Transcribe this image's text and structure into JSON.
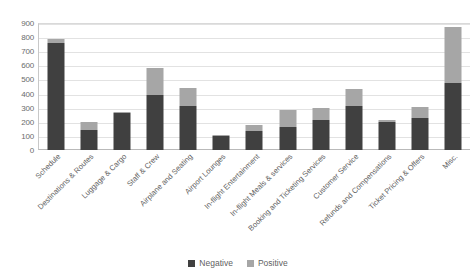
{
  "chart_data": {
    "type": "bar",
    "stacked": true,
    "title": "",
    "subtitle": "",
    "xlabel": "",
    "ylabel": "",
    "ylim": [
      0,
      900
    ],
    "ytick_step": 100,
    "yticks": [
      "900",
      "800",
      "700",
      "600",
      "500",
      "400",
      "300",
      "200",
      "100",
      "0"
    ],
    "grid": true,
    "legend_position": "bottom",
    "categories": [
      "Schedule",
      "Destinations & Routes",
      "Luggage & Cargo",
      "Staff & Crew",
      "Airplane and Seating",
      "Airport Lounges",
      "In-flight Entertainment",
      "In-flight Meals & services",
      "Booking and Ticketing Services",
      "Customer Service",
      "Refunds and Compensations",
      "Ticket Pricing & Offers",
      "Misc."
    ],
    "series": [
      {
        "name": "Negative",
        "color": "#404040",
        "values": [
          755,
          140,
          265,
          390,
          312,
          100,
          135,
          165,
          215,
          310,
          195,
          230,
          475
        ]
      },
      {
        "name": "Positive",
        "color": "#a6a6a6",
        "values": [
          35,
          60,
          5,
          190,
          131,
          5,
          40,
          120,
          85,
          120,
          15,
          75,
          400
        ]
      }
    ],
    "totals": [
      790,
      200,
      270,
      580,
      443,
      105,
      175,
      285,
      300,
      430,
      210,
      305,
      875
    ]
  },
  "legend": {
    "items": [
      {
        "label": "Negative",
        "color": "#404040",
        "swatch_name": "legend-swatch-negative"
      },
      {
        "label": "Positive",
        "color": "#a6a6a6",
        "swatch_name": "legend-swatch-positive"
      }
    ]
  }
}
